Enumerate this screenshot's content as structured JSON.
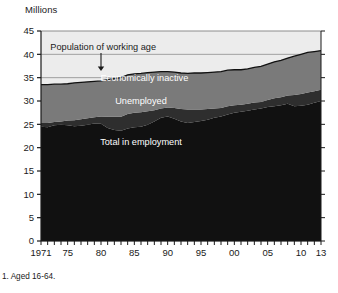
{
  "chart_data": {
    "type": "area",
    "stacked": true,
    "title": "",
    "ylabel": "Millions",
    "xlabel": "",
    "ylim": [
      0,
      45
    ],
    "ytick_step": 5,
    "yticks": [
      "0",
      "5",
      "10",
      "15",
      "20",
      "25",
      "30",
      "35",
      "40",
      "45"
    ],
    "xlim": [
      1971,
      2013
    ],
    "xticks_labeled": [
      "1971",
      "75",
      "80",
      "85",
      "90",
      "95",
      "00",
      "05",
      "10",
      "13"
    ],
    "xticks_labeled_years": [
      1971,
      1975,
      1980,
      1985,
      1990,
      1995,
      2000,
      2005,
      2010,
      2013
    ],
    "xtick_interval_years": 1,
    "grid": true,
    "legend_position": "in-plot-labels",
    "footnote": "1. Aged 16-64.",
    "annotation": {
      "text": "Population of working age",
      "points_to_year": 1980,
      "points_to_value": 36.2,
      "arrow": "down"
    },
    "series": [
      {
        "name": "Total in employment",
        "color": "#111111",
        "label_in_plot": "Total in employment",
        "x": [
          1971,
          1972,
          1973,
          1974,
          1975,
          1976,
          1977,
          1978,
          1979,
          1980,
          1981,
          1982,
          1983,
          1984,
          1985,
          1986,
          1987,
          1988,
          1989,
          1990,
          1991,
          1992,
          1993,
          1994,
          1995,
          1996,
          1997,
          1998,
          1999,
          2000,
          2001,
          2002,
          2003,
          2004,
          2005,
          2006,
          2007,
          2008,
          2009,
          2010,
          2011,
          2012,
          2013
        ],
        "values": [
          24.5,
          24.4,
          24.8,
          24.9,
          24.8,
          24.6,
          24.7,
          24.9,
          25.2,
          25.1,
          24.2,
          23.8,
          23.6,
          24.1,
          24.4,
          24.5,
          24.9,
          25.6,
          26.4,
          26.7,
          26.2,
          25.6,
          25.3,
          25.5,
          25.7,
          26.0,
          26.4,
          26.7,
          27.1,
          27.5,
          27.7,
          27.9,
          28.2,
          28.4,
          28.7,
          28.9,
          29.1,
          29.4,
          28.9,
          29.0,
          29.2,
          29.6,
          30.0
        ]
      },
      {
        "name": "Unemployed",
        "color": "#2e2e2e",
        "label_in_plot": "Unemployed",
        "x": [
          1971,
          1972,
          1973,
          1974,
          1975,
          1976,
          1977,
          1978,
          1979,
          1980,
          1981,
          1982,
          1983,
          1984,
          1985,
          1986,
          1987,
          1988,
          1989,
          1990,
          1991,
          1992,
          1993,
          1994,
          1995,
          1996,
          1997,
          1998,
          1999,
          2000,
          2001,
          2002,
          2003,
          2004,
          2005,
          2006,
          2007,
          2008,
          2009,
          2010,
          2011,
          2012,
          2013
        ],
        "values": [
          0.8,
          0.9,
          0.7,
          0.7,
          1.0,
          1.3,
          1.4,
          1.4,
          1.3,
          1.6,
          2.4,
          2.8,
          3.0,
          3.1,
          3.1,
          3.1,
          2.9,
          2.4,
          2.0,
          1.9,
          2.3,
          2.7,
          2.9,
          2.7,
          2.5,
          2.3,
          2.0,
          1.8,
          1.8,
          1.6,
          1.5,
          1.5,
          1.5,
          1.4,
          1.5,
          1.7,
          1.7,
          1.8,
          2.4,
          2.5,
          2.6,
          2.5,
          2.4
        ]
      },
      {
        "name": "Economically inactive",
        "color": "#7a7a7a",
        "label_in_plot": "Economically inactive",
        "x": [
          1971,
          1972,
          1973,
          1974,
          1975,
          1976,
          1977,
          1978,
          1979,
          1980,
          1981,
          1982,
          1983,
          1984,
          1985,
          1986,
          1987,
          1988,
          1989,
          1990,
          1991,
          1992,
          1993,
          1994,
          1995,
          1996,
          1997,
          1998,
          1999,
          2000,
          2001,
          2002,
          2003,
          2004,
          2005,
          2006,
          2007,
          2008,
          2009,
          2010,
          2011,
          2012,
          2013
        ],
        "values": [
          8.2,
          8.2,
          8.1,
          8.0,
          7.9,
          8.0,
          7.9,
          7.8,
          7.7,
          7.6,
          8.0,
          8.2,
          8.4,
          8.4,
          8.3,
          8.3,
          8.3,
          8.2,
          7.9,
          7.7,
          7.7,
          7.7,
          7.7,
          7.8,
          7.8,
          7.8,
          7.8,
          7.8,
          7.7,
          7.6,
          7.5,
          7.5,
          7.5,
          7.6,
          7.7,
          7.8,
          7.9,
          8.0,
          8.3,
          8.5,
          8.6,
          8.5,
          8.4
        ]
      }
    ],
    "total_line": {
      "name": "Population of working age",
      "x": [
        1971,
        1972,
        1973,
        1974,
        1975,
        1976,
        1977,
        1978,
        1979,
        1980,
        1981,
        1982,
        1983,
        1984,
        1985,
        1986,
        1987,
        1988,
        1989,
        1990,
        1991,
        1992,
        1993,
        1994,
        1995,
        1996,
        1997,
        1998,
        1999,
        2000,
        2001,
        2002,
        2003,
        2004,
        2005,
        2006,
        2007,
        2008,
        2009,
        2010,
        2011,
        2012,
        2013
      ],
      "values": [
        33.5,
        33.5,
        33.6,
        33.6,
        33.7,
        33.9,
        34.0,
        34.1,
        34.2,
        34.3,
        34.6,
        34.8,
        35.0,
        35.6,
        35.8,
        35.9,
        36.1,
        36.2,
        36.3,
        36.3,
        36.2,
        36.0,
        35.9,
        36.0,
        36.0,
        36.1,
        36.2,
        36.3,
        36.6,
        36.7,
        36.7,
        36.9,
        37.2,
        37.4,
        37.9,
        38.4,
        38.7,
        39.2,
        39.6,
        40.0,
        40.4,
        40.6,
        40.8
      ]
    }
  },
  "colors": {
    "employment": "#111111",
    "unemployed": "#2e2e2e",
    "inactive": "#7a7a7a",
    "plot_background": "#ececec",
    "axis": "#1a1a1a",
    "gridline": "#8c8c8c",
    "label_text": "#ffffff"
  }
}
